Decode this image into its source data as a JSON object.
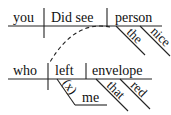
{
  "diagram": {
    "type": "reed-kellogg-sentence-diagram",
    "main_clause": {
      "subject": "you",
      "verb": "Did see",
      "object": "person",
      "object_modifiers": [
        "the",
        "nice"
      ]
    },
    "relative_clause": {
      "subject": "who",
      "verb": "left",
      "object": "envelope",
      "object_modifiers": [
        "that",
        "red"
      ],
      "indirect_object_preposition": "(x)",
      "indirect_object": "me"
    },
    "connector": "dashed-curve"
  }
}
